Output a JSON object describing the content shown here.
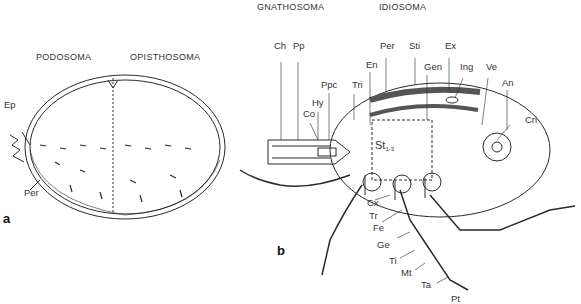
{
  "panels": {
    "a": {
      "letter": "a",
      "regions": [
        "PODOSOMA",
        "OPISTHOSOMA"
      ],
      "labels": [
        "Ep",
        "Per"
      ]
    },
    "b": {
      "letter": "b",
      "regions": [
        "GNATHOSOMA",
        "IDIOSOMA"
      ],
      "labels": {
        "ch": "Ch",
        "pp": "Pp",
        "ppc": "Ppc",
        "hy": "Hy",
        "co": "Co",
        "tri": "Tri",
        "en": "En",
        "per": "Per",
        "sti": "Sti",
        "gen": "Gen",
        "ex": "Ex",
        "ing": "Ing",
        "ve": "Ve",
        "an": "An",
        "cri": "Cri",
        "st": "St",
        "st_sub": "1-3",
        "cx": "Cx",
        "tr": "Tr",
        "fe": "Fe",
        "ge": "Ge",
        "ti": "Ti",
        "mt": "Mt",
        "ta": "Ta",
        "pt": "Pt"
      }
    }
  },
  "colors": {
    "line": "#2a2a2a",
    "shade": "#555555",
    "background": "#ffffff"
  }
}
